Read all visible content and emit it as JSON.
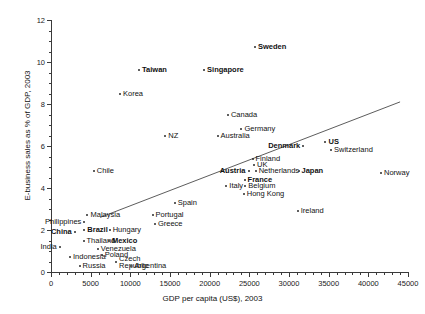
{
  "chart_data": {
    "type": "scatter",
    "title": "",
    "xlabel": "GDP per capita (US$), 2003",
    "ylabel": "E-business sales as % of GDP, 2003",
    "xlim": [
      0,
      45000
    ],
    "ylim": [
      0,
      12
    ],
    "xticks": [
      0,
      5000,
      10000,
      15000,
      20000,
      25000,
      30000,
      35000,
      40000,
      45000
    ],
    "yticks": [
      0,
      2,
      4,
      6,
      8,
      10,
      12
    ],
    "grid": false,
    "legend": null,
    "trendline": {
      "x0": 6200,
      "y0": 2.6,
      "x1": 44000,
      "y1": 8.1
    },
    "points": [
      {
        "name": "Sweden",
        "x": 25700,
        "y": 10.7,
        "bold": true,
        "anchor": "left"
      },
      {
        "name": "Taiwan",
        "x": 11100,
        "y": 9.6,
        "bold": true,
        "anchor": "left"
      },
      {
        "name": "Singapore",
        "x": 19300,
        "y": 9.6,
        "bold": true,
        "anchor": "left"
      },
      {
        "name": "Korea",
        "x": 8700,
        "y": 8.5,
        "bold": false,
        "anchor": "left"
      },
      {
        "name": "Canada",
        "x": 22300,
        "y": 7.5,
        "bold": false,
        "anchor": "left"
      },
      {
        "name": "Germany",
        "x": 24000,
        "y": 6.8,
        "bold": false,
        "anchor": "left"
      },
      {
        "name": "Australia",
        "x": 21000,
        "y": 6.5,
        "bold": false,
        "anchor": "left"
      },
      {
        "name": "NZ",
        "x": 14400,
        "y": 6.5,
        "bold": false,
        "anchor": "left"
      },
      {
        "name": "Denmark",
        "x": 31800,
        "y": 6.0,
        "bold": true,
        "anchor": "right"
      },
      {
        "name": "US",
        "x": 34600,
        "y": 6.2,
        "bold": true,
        "anchor": "left"
      },
      {
        "name": "Switzerland",
        "x": 35300,
        "y": 5.8,
        "bold": false,
        "anchor": "left"
      },
      {
        "name": "Finland",
        "x": 25400,
        "y": 5.4,
        "bold": false,
        "anchor": "left"
      },
      {
        "name": "UK",
        "x": 25600,
        "y": 5.1,
        "bold": false,
        "anchor": "left"
      },
      {
        "name": "Netherlands",
        "x": 25800,
        "y": 4.8,
        "bold": false,
        "anchor": "left"
      },
      {
        "name": "Austria",
        "x": 24900,
        "y": 4.8,
        "bold": true,
        "anchor": "right"
      },
      {
        "name": "Japan",
        "x": 31200,
        "y": 4.8,
        "bold": true,
        "anchor": "left"
      },
      {
        "name": "France",
        "x": 24400,
        "y": 4.4,
        "bold": true,
        "anchor": "left"
      },
      {
        "name": "Belgium",
        "x": 24500,
        "y": 4.1,
        "bold": false,
        "anchor": "left"
      },
      {
        "name": "Italy",
        "x": 22100,
        "y": 4.1,
        "bold": false,
        "anchor": "left"
      },
      {
        "name": "Hong Kong",
        "x": 24300,
        "y": 3.7,
        "bold": false,
        "anchor": "left"
      },
      {
        "name": "Norway",
        "x": 41600,
        "y": 4.7,
        "bold": false,
        "anchor": "left"
      },
      {
        "name": "Ireland",
        "x": 31100,
        "y": 2.9,
        "bold": false,
        "anchor": "left"
      },
      {
        "name": "Spain",
        "x": 15600,
        "y": 3.3,
        "bold": false,
        "anchor": "left"
      },
      {
        "name": "Chile",
        "x": 5400,
        "y": 4.8,
        "bold": false,
        "anchor": "left"
      },
      {
        "name": "Malaysia",
        "x": 4600,
        "y": 2.7,
        "bold": false,
        "anchor": "left"
      },
      {
        "name": "Portugal",
        "x": 12800,
        "y": 2.7,
        "bold": false,
        "anchor": "left"
      },
      {
        "name": "Greece",
        "x": 13100,
        "y": 2.3,
        "bold": false,
        "anchor": "left"
      },
      {
        "name": "Philippines",
        "x": 4200,
        "y": 2.4,
        "bold": false,
        "anchor": "right"
      },
      {
        "name": "China",
        "x": 3000,
        "y": 1.9,
        "bold": true,
        "anchor": "right"
      },
      {
        "name": "Brazil",
        "x": 4200,
        "y": 2.0,
        "bold": true,
        "anchor": "left"
      },
      {
        "name": "Hungary",
        "x": 7400,
        "y": 2.0,
        "bold": false,
        "anchor": "left"
      },
      {
        "name": "Thailand",
        "x": 4100,
        "y": 1.5,
        "bold": false,
        "anchor": "left"
      },
      {
        "name": "Mexico",
        "x": 7300,
        "y": 1.5,
        "bold": true,
        "anchor": "left"
      },
      {
        "name": "India",
        "x": 1100,
        "y": 1.2,
        "bold": false,
        "anchor": "right"
      },
      {
        "name": "Venezuela",
        "x": 5900,
        "y": 1.1,
        "bold": false,
        "anchor": "left"
      },
      {
        "name": "Poland",
        "x": 6400,
        "y": 0.8,
        "bold": false,
        "anchor": "left"
      },
      {
        "name": "Indonesia",
        "x": 2400,
        "y": 0.7,
        "bold": false,
        "anchor": "left"
      },
      {
        "name": "Russia",
        "x": 3600,
        "y": 0.3,
        "bold": false,
        "anchor": "left"
      },
      {
        "name": "Czech Republic",
        "x": 8200,
        "y": 0.5,
        "bold": false,
        "anchor": "left"
      },
      {
        "name": "Argentina",
        "x": 10100,
        "y": 0.3,
        "bold": false,
        "anchor": "left"
      }
    ]
  }
}
